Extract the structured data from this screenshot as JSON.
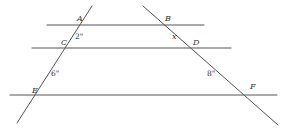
{
  "diagram": {
    "type": "parallel-lines-transversals",
    "colors": {
      "line": "#555555",
      "text": "#333333",
      "background": "#ffffff"
    },
    "parallel_lines": [
      {
        "id": "AB",
        "x1": 47,
        "y1": 25,
        "x2": 204,
        "y2": 25
      },
      {
        "id": "CD",
        "x1": 32,
        "y1": 48,
        "x2": 231,
        "y2": 48
      },
      {
        "id": "EF",
        "x1": 10,
        "y1": 95,
        "x2": 277,
        "y2": 95
      }
    ],
    "transversals": [
      {
        "id": "ACE",
        "x1": 92,
        "y1": 6,
        "x2": 17,
        "y2": 123
      },
      {
        "id": "BDF",
        "x1": 143,
        "y1": 6,
        "x2": 278,
        "y2": 125
      }
    ],
    "points": {
      "A": {
        "label": "A",
        "x": 77,
        "y": 21
      },
      "B": {
        "label": "B",
        "x": 165,
        "y": 21
      },
      "C": {
        "label": "C",
        "x": 61,
        "y": 45
      },
      "D": {
        "label": "D",
        "x": 193,
        "y": 45
      },
      "E": {
        "label": "E",
        "x": 32,
        "y": 93
      },
      "F": {
        "label": "F",
        "x": 250,
        "y": 89
      }
    },
    "segment_labels": {
      "AC": {
        "text": "2\"",
        "x": 75,
        "y": 39
      },
      "BD": {
        "text": "x",
        "x": 172,
        "y": 39
      },
      "CE": {
        "text": "6\"",
        "x": 51,
        "y": 76
      },
      "DF": {
        "text": "8\"",
        "x": 207,
        "y": 76
      }
    }
  }
}
